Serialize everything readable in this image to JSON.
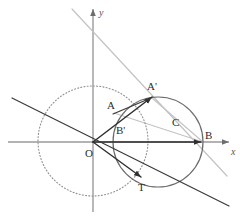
{
  "figure": {
    "type": "geometry-diagram",
    "width": 240,
    "height": 222,
    "background_color": "#ffffff"
  },
  "colors": {
    "axis": "#9a9a9a",
    "dotted_circle": "#8f8f8f",
    "solid_circle": "#6b6b6b",
    "dark_line": "#3a3a3a",
    "vector": "#2f2f2f",
    "light_line": "#c3c3c3",
    "label_text": "#2b2b2b",
    "axis_label_text": "#555555"
  },
  "axes": {
    "origin": {
      "x": 93,
      "y": 142,
      "label": "O",
      "label_x": 85,
      "label_y": 156
    },
    "x_axis": {
      "label": "x",
      "label_x": 231,
      "label_y": 155,
      "from_x": 8,
      "to_x": 229,
      "y": 142,
      "arrow": true
    },
    "y_axis": {
      "label": "y",
      "label_x": 99,
      "label_y": 16,
      "from_y": 212,
      "to_y": 9,
      "x": 93,
      "arrow": true
    }
  },
  "circles": [
    {
      "name": "unit-circle",
      "style": "dotted",
      "cx": 93,
      "cy": 141,
      "r": 55,
      "stroke": "#8f8f8f",
      "dash": "1,2.2"
    },
    {
      "name": "circle-C",
      "style": "solid",
      "cx": 158,
      "cy": 142,
      "r": 45,
      "stroke": "#6b6b6b",
      "label": "C",
      "label_x": 172,
      "label_y": 126
    }
  ],
  "points": [
    {
      "name": "O",
      "label": "O",
      "x": 93,
      "y": 142,
      "label_x": 85,
      "label_y": 157
    },
    {
      "name": "A",
      "label": "A",
      "x": 115,
      "y": 112,
      "label_x": 107,
      "label_y": 109
    },
    {
      "name": "Ap",
      "label": "A'",
      "x": 152,
      "y": 97,
      "label_x": 147,
      "label_y": 90
    },
    {
      "name": "Bp",
      "label": "B'",
      "x": 113,
      "y": 142,
      "label_x": 116,
      "label_y": 134
    },
    {
      "name": "B",
      "label": "B",
      "x": 203,
      "y": 142,
      "label_x": 205,
      "label_y": 139
    },
    {
      "name": "T",
      "label": "T",
      "x": 141,
      "y": 177,
      "label_x": 138,
      "label_y": 191
    }
  ],
  "segments": [
    {
      "name": "vector-O-A-prime",
      "from": "O",
      "to": "A'",
      "x1": 93,
      "y1": 142,
      "x2": 152,
      "y2": 97,
      "stroke": "#2f2f2f",
      "width": 1.5,
      "arrow": true
    },
    {
      "name": "vector-O-B",
      "from": "O",
      "to": "B",
      "x1": 93,
      "y1": 142,
      "x2": 201,
      "y2": 142,
      "stroke": "#2f2f2f",
      "width": 1.5,
      "arrow": true
    },
    {
      "name": "vector-O-T",
      "from": "O",
      "to": "T",
      "x1": 93,
      "y1": 142,
      "x2": 141,
      "y2": 177,
      "stroke": "#2f2f2f",
      "width": 1.4,
      "arrow": true
    },
    {
      "name": "chord-A-A-prime",
      "from": "A",
      "to": "A'",
      "x1": 113,
      "y1": 114,
      "x2": 151,
      "y2": 98,
      "stroke": "#3a3a3a",
      "width": 1.2,
      "arrow": false
    },
    {
      "name": "secant-line",
      "from": "upper-left",
      "to": "lower-right",
      "x1": 12,
      "y1": 98,
      "x2": 229,
      "y2": 206,
      "stroke": "#3a3a3a",
      "width": 1.2,
      "arrow": false
    },
    {
      "name": "light-line-through-A-prime",
      "from": "upper-left",
      "to": "lower-right",
      "x1": 72,
      "y1": 9,
      "x2": 227,
      "y2": 176,
      "stroke": "#c3c3c3",
      "width": 1.2,
      "arrow": false
    },
    {
      "name": "light-chord-A-B",
      "from": "A",
      "to": "B",
      "x1": 114,
      "y1": 113,
      "x2": 203,
      "y2": 142,
      "stroke": "#c3c3c3",
      "width": 1.1,
      "arrow": false
    },
    {
      "name": "light-chord-A-prime-B",
      "from": "A'",
      "to": "B",
      "x1": 152,
      "y1": 98,
      "x2": 203,
      "y2": 142,
      "stroke": "#c3c3c3",
      "width": 1.1,
      "arrow": false
    }
  ],
  "labels": {
    "O": "O",
    "A": "A",
    "A_prime": "A'",
    "B_prime": "B'",
    "B": "B",
    "T": "T",
    "C": "C",
    "x_axis": "x",
    "y_axis": "y"
  }
}
